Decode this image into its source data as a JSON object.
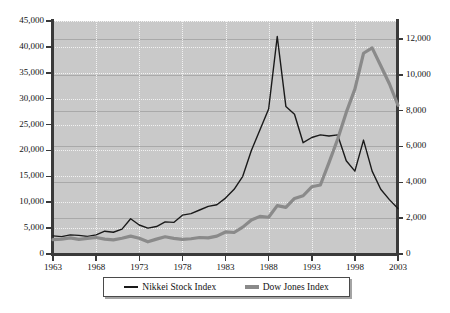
{
  "chart_data": {
    "type": "line",
    "title": "",
    "subtitle": "",
    "xlabel": "",
    "ylabel": "",
    "y2label": "",
    "grid": true,
    "legend_position": "bottom",
    "x": [
      1963,
      1964,
      1965,
      1966,
      1967,
      1968,
      1969,
      1970,
      1971,
      1972,
      1973,
      1974,
      1975,
      1976,
      1977,
      1978,
      1979,
      1980,
      1981,
      1982,
      1983,
      1984,
      1985,
      1986,
      1987,
      1988,
      1989,
      1990,
      1991,
      1992,
      1993,
      1994,
      1995,
      1996,
      1997,
      1998,
      1999,
      2000,
      2001,
      2002,
      2003
    ],
    "xticks": [
      1963,
      1968,
      1973,
      1978,
      1983,
      1988,
      1993,
      1998,
      2003
    ],
    "xtick_labels": [
      "1963",
      "1968",
      "1973",
      "1978",
      "1983",
      "1988",
      "1993",
      "1998",
      "2003"
    ],
    "xlim": [
      1963,
      2003
    ],
    "left_axis": {
      "label": "Nikkei Stock Index",
      "ylim": [
        0,
        45000
      ],
      "ticks": [
        0,
        5000,
        10000,
        15000,
        20000,
        25000,
        30000,
        35000,
        40000,
        45000
      ],
      "tick_labels": [
        "0",
        "5,000",
        "10,000",
        "15,000",
        "20,000",
        "25,000",
        "30,000",
        "35,000",
        "40,000",
        "45,000"
      ]
    },
    "right_axis": {
      "label": "Dow Jones Index",
      "ylim": [
        0,
        13000
      ],
      "ticks": [
        0,
        2000,
        4000,
        6000,
        8000,
        10000,
        12000
      ],
      "tick_labels": [
        "0",
        "2,000",
        "4,000",
        "6,000",
        "8,000",
        "10,000",
        "12,000"
      ]
    },
    "series": [
      {
        "name": "Nikkei Stock Index",
        "axis": "left",
        "color": "#1a1a1a",
        "line_width": 1.4,
        "values": [
          3500,
          3350,
          3700,
          3600,
          3400,
          3700,
          4400,
          4200,
          4800,
          6800,
          5600,
          5000,
          5300,
          6200,
          6100,
          7500,
          7800,
          8500,
          9200,
          9500,
          10800,
          12500,
          15000,
          20000,
          24000,
          28000,
          42000,
          28500,
          27000,
          21500,
          22500,
          23000,
          22800,
          23000,
          18000,
          16000,
          22000,
          16000,
          12500,
          10500,
          8800
        ]
      },
      {
        "name": "Dow Jones Index",
        "axis": "right",
        "color": "#8a8a8a",
        "line_width": 3.2,
        "values": [
          800,
          830,
          900,
          820,
          870,
          920,
          830,
          790,
          880,
          1000,
          880,
          680,
          830,
          960,
          870,
          820,
          850,
          920,
          900,
          1000,
          1230,
          1200,
          1500,
          1900,
          2100,
          2050,
          2700,
          2600,
          3100,
          3250,
          3750,
          3850,
          5100,
          6400,
          7900,
          9200,
          11200,
          11500,
          10500,
          9500,
          8300
        ]
      }
    ]
  },
  "legend": {
    "entries": [
      {
        "label": "Nikkei Stock Index",
        "swatch": "thin-dark-line"
      },
      {
        "label": "Dow Jones Index",
        "swatch": "thick-gray-line"
      }
    ]
  },
  "colors": {
    "plot_background": "#c9c9c9",
    "axis": "#3a3a3a",
    "grid_dotted": "#f2f2f2",
    "grid_solid": "#a9a9a9",
    "nikkei": "#1a1a1a",
    "dow": "#8a8a8a",
    "text": "#131313"
  }
}
